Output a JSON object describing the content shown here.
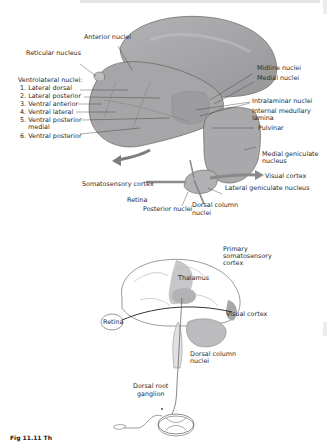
{
  "figure": {
    "caption": "Fig 11.11 Th",
    "top_diagram": {
      "title": "Thalamic nuclei",
      "labels": {
        "anterior_nuclei": "Anterior nuclei",
        "reticular_nucleus": "Reticular nucleus",
        "ventrolateral_heading": "Ventrolateral nuclei:",
        "ventrolateral_items": [
          "1. Lateral dorsal",
          "2. Lateral posterior",
          "3. Ventral anterior",
          "4. Ventral lateral",
          "5. Ventral posterior",
          "medial",
          "6. Ventral posterior"
        ],
        "midline_nuclei": "Midline nuclei",
        "medial_nuclei": "Medial nuclei",
        "intralaminar_nuclei": "Intralaminar nuclei",
        "internal_medullary_lamina_1": "Internal medullary",
        "internal_medullary_lamina_2": "lamina",
        "pulvinar": "Pulvinar",
        "medial_geniculate_1": "Medial geniculate",
        "medial_geniculate_2": "nucleus",
        "somatosensory_cortex": "Somatosensory cortex",
        "visual_cortex": "Visual cortex",
        "retina": "Retina",
        "lateral_geniculate": "Lateral geniculate nucleus",
        "posterior_nuclei": "Posterior nuclei",
        "dorsal_column_1": "Dorsal column",
        "dorsal_column_2": "nuclei"
      }
    },
    "bottom_diagram": {
      "labels": {
        "primary_somatosensory_1": "Primary",
        "primary_somatosensory_2": "somatosensory",
        "primary_somatosensory_3": "cortex",
        "thalamus": "Thalamus",
        "retina": "Retina",
        "visual_cortex": "Visual cortex",
        "dorsal_column_1": "Dorsal column",
        "dorsal_column_2": "nuclei",
        "dorsal_root_1": "Dorsal root",
        "dorsal_root_2": "ganglion"
      }
    },
    "colors": {
      "nucleus_fill": "#a9a9ab",
      "nucleus_dark": "#8f8f92",
      "pathway_arrow": "#7d7d80",
      "brain_outline": "#555555",
      "highlight_cortex": "#b8b8b8"
    }
  }
}
